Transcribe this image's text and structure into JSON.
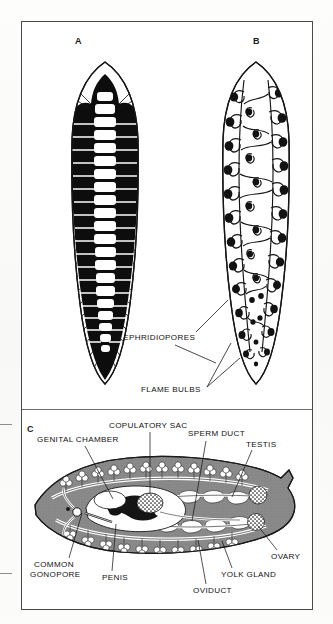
{
  "figure": {
    "panels": [
      {
        "id": "A",
        "letter": "A",
        "name": "digestive-system"
      },
      {
        "id": "B",
        "letter": "B",
        "name": "protonephridial-system"
      },
      {
        "id": "C",
        "letter": "C",
        "name": "reproductive-system"
      }
    ]
  },
  "labels": {
    "excretory": [
      {
        "key": "nephridiopores",
        "text": "NEPHRIDIOPORES"
      },
      {
        "key": "flame_bulbs",
        "text": "FLAME  BULBS"
      }
    ],
    "reproductive_top": [
      {
        "key": "copulatory_sac",
        "text": "COPULATORY  SAC"
      },
      {
        "key": "genital_chamber",
        "text": "GENITAL  CHAMBER"
      },
      {
        "key": "sperm_duct",
        "text": "SPERM  DUCT"
      },
      {
        "key": "testis",
        "text": "TESTIS"
      }
    ],
    "reproductive_bottom": [
      {
        "key": "common_gonopore_l1",
        "text": "COMMON"
      },
      {
        "key": "common_gonopore_l2",
        "text": "GONOPORE"
      },
      {
        "key": "penis",
        "text": "PENIS"
      },
      {
        "key": "oviduct",
        "text": "OVIDUCT"
      },
      {
        "key": "yolk_gland",
        "text": "YOLK  GLAND"
      },
      {
        "key": "ovary",
        "text": "OVARY"
      }
    ]
  },
  "colors": {
    "ink": "#111111",
    "frame": "#4a4a4a",
    "body_gray": "#8a8a8a",
    "gut_black": "#0d0d0d",
    "paper": "#ffffff"
  }
}
